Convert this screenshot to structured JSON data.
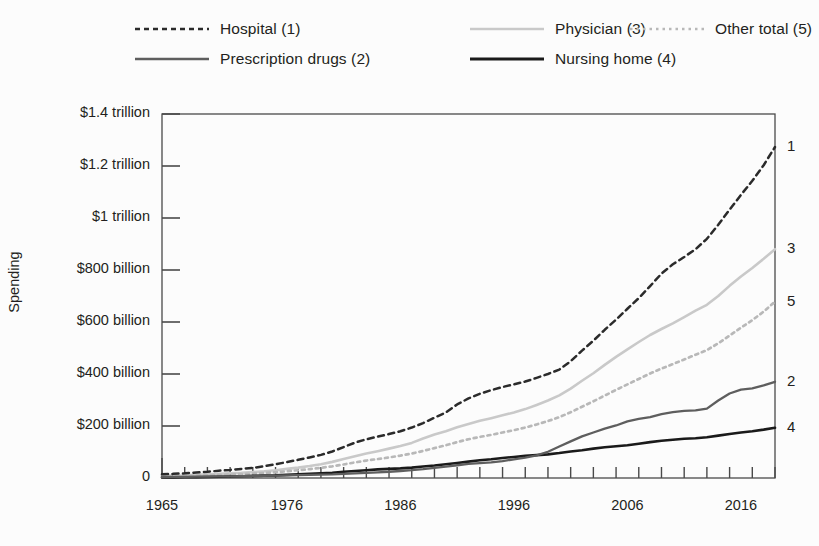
{
  "legend": {
    "items": [
      {
        "label": "Hospital (1)",
        "style": "dashed-dark",
        "color": "#2b2b2b",
        "col": 0,
        "row": 0
      },
      {
        "label": "Prescription drugs (2)",
        "style": "solid-mid",
        "color": "#5e5e5e",
        "col": 0,
        "row": 1
      },
      {
        "label": "Physician (3)",
        "style": "solid-light",
        "color": "#c9c9c9",
        "col": 1,
        "row": 0
      },
      {
        "label": "Nursing home (4)",
        "style": "solid-dark",
        "color": "#1a1a1a",
        "col": 1,
        "row": 1
      },
      {
        "label": "Other total (5)",
        "style": "dotted-light",
        "color": "#b8b8b8",
        "col": 2,
        "row": 0
      }
    ]
  },
  "axes": {
    "ylabel": "Spending",
    "ytick_labels": [
      "$1.4 trillion",
      "$1.2 trillion",
      "$1 trillion",
      "$800 billion",
      "$600 billion",
      "$400 billion",
      "$200 billion",
      "0"
    ],
    "ytick_values": [
      1400,
      1200,
      1000,
      800,
      600,
      400,
      200,
      0
    ],
    "xtick_labels": [
      "1965",
      "1976",
      "1986",
      "1996",
      "2006",
      "2016"
    ],
    "xtick_values": [
      1965,
      1976,
      1986,
      1996,
      2006,
      2016
    ]
  },
  "end_labels": [
    {
      "text": "1",
      "series": "Hospital"
    },
    {
      "text": "3",
      "series": "Physician"
    },
    {
      "text": "5",
      "series": "Other total"
    },
    {
      "text": "2",
      "series": "Prescription drugs"
    },
    {
      "text": "4",
      "series": "Nursing home"
    }
  ],
  "chart_data": {
    "type": "line",
    "title": "",
    "xlabel": "",
    "ylabel": "Spending",
    "xlim": [
      1965,
      2019
    ],
    "ylim": [
      0,
      1400
    ],
    "y_unit": "billions of US dollars",
    "grid": false,
    "legend_position": "top",
    "x": [
      1965,
      1966,
      1967,
      1968,
      1969,
      1970,
      1971,
      1972,
      1973,
      1974,
      1975,
      1976,
      1977,
      1978,
      1979,
      1980,
      1981,
      1982,
      1983,
      1984,
      1985,
      1986,
      1987,
      1988,
      1989,
      1990,
      1991,
      1992,
      1993,
      1994,
      1995,
      1996,
      1997,
      1998,
      1999,
      2000,
      2001,
      2002,
      2003,
      2004,
      2005,
      2006,
      2007,
      2008,
      2009,
      2010,
      2011,
      2012,
      2013,
      2014,
      2015,
      2016,
      2017,
      2018,
      2019
    ],
    "series": [
      {
        "name": "Hospital (1)",
        "id": 1,
        "style": "dashed",
        "color": "#2b2b2b",
        "values": [
          14,
          16,
          18,
          21,
          24,
          28,
          31,
          35,
          39,
          45,
          53,
          61,
          70,
          79,
          89,
          102,
          119,
          136,
          149,
          159,
          169,
          180,
          194,
          211,
          232,
          252,
          283,
          306,
          324,
          338,
          350,
          360,
          371,
          385,
          400,
          417,
          449,
          490,
          528,
          570,
          609,
          651,
          692,
          738,
          786,
          822,
          850,
          880,
          920,
          974,
          1032,
          1089,
          1143,
          1203,
          1273
        ]
      },
      {
        "name": "Prescription drugs (2)",
        "id": 2,
        "style": "solid",
        "color": "#5e5e5e",
        "values": [
          3,
          4,
          4,
          5,
          5,
          6,
          6,
          7,
          7,
          8,
          9,
          10,
          11,
          12,
          13,
          14,
          16,
          18,
          20,
          22,
          24,
          27,
          30,
          34,
          39,
          44,
          49,
          54,
          57,
          60,
          65,
          72,
          78,
          87,
          101,
          121,
          141,
          160,
          175,
          190,
          202,
          218,
          227,
          234,
          246,
          253,
          258,
          260,
          267,
          298,
          325,
          340,
          345,
          356,
          370
        ]
      },
      {
        "name": "Physician (3)",
        "id": 3,
        "style": "solid",
        "color": "#c9c9c9",
        "values": [
          8,
          9,
          10,
          12,
          14,
          16,
          18,
          20,
          23,
          26,
          30,
          35,
          40,
          46,
          53,
          62,
          73,
          84,
          94,
          103,
          113,
          123,
          135,
          152,
          167,
          180,
          195,
          208,
          220,
          230,
          241,
          252,
          265,
          281,
          298,
          318,
          344,
          374,
          403,
          435,
          466,
          495,
          523,
          550,
          573,
          595,
          619,
          644,
          666,
          700,
          739,
          775,
          808,
          843,
          880
        ]
      },
      {
        "name": "Nursing home (4)",
        "id": 4,
        "style": "solid",
        "color": "#1a1a1a",
        "values": [
          2,
          2,
          3,
          3,
          4,
          5,
          6,
          7,
          8,
          9,
          10,
          12,
          14,
          16,
          18,
          20,
          24,
          27,
          30,
          33,
          35,
          37,
          40,
          44,
          48,
          53,
          58,
          63,
          68,
          72,
          77,
          81,
          85,
          88,
          91,
          96,
          102,
          107,
          113,
          118,
          122,
          126,
          132,
          138,
          143,
          147,
          151,
          153,
          157,
          163,
          169,
          175,
          180,
          186,
          193
        ]
      },
      {
        "name": "Other total (5)",
        "id": 5,
        "style": "dotted",
        "color": "#b8b8b8",
        "values": [
          6,
          7,
          8,
          9,
          10,
          12,
          13,
          15,
          17,
          19,
          22,
          26,
          30,
          34,
          39,
          45,
          52,
          60,
          67,
          73,
          79,
          86,
          94,
          104,
          115,
          126,
          138,
          149,
          158,
          166,
          175,
          184,
          194,
          206,
          219,
          234,
          253,
          274,
          295,
          317,
          339,
          360,
          381,
          402,
          421,
          438,
          456,
          474,
          492,
          518,
          548,
          578,
          607,
          640,
          678
        ]
      }
    ]
  }
}
